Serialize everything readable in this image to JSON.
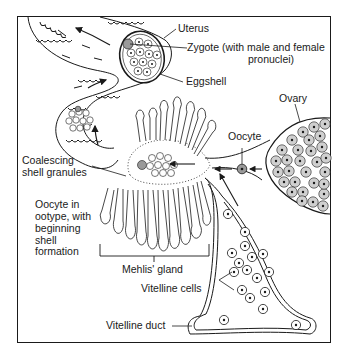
{
  "figure": {
    "labels": {
      "uterus": "Uterus",
      "zygote_line1": "Zygote (with male and female",
      "zygote_line2": "pronuclei)",
      "eggshell": "Eggshell",
      "ovary": "Ovary",
      "oocyte": "Oocyte",
      "coalescing_line1": "Coalescing",
      "coalescing_line2": "shell granules",
      "ootype_line1": "Oocyte in",
      "ootype_line2": "ootype, with",
      "ootype_line3": "beginning",
      "ootype_line4": "shell",
      "ootype_line5": "formation",
      "mehlis": "Mehlis' gland",
      "vitelline_cells": "Vitelline cells",
      "vitelline_duct": "Vitelline duct"
    },
    "colors": {
      "ink": "#1a1a1a",
      "background": "#ffffff",
      "cell_fill": "#d0d0d0"
    }
  }
}
